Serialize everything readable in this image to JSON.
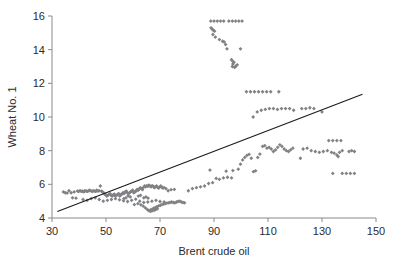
{
  "chart_data": {
    "type": "scatter",
    "title": "",
    "xlabel": "Brent crude oil",
    "ylabel": "Wheat No. 1",
    "xlim": [
      30,
      150
    ],
    "ylim": [
      4,
      16
    ],
    "xticks": [
      30,
      50,
      70,
      90,
      110,
      130,
      150
    ],
    "yticks": [
      4,
      6,
      8,
      10,
      12,
      14,
      16
    ],
    "grid": false,
    "legend": null,
    "marker_color": "#808285",
    "marker_shape": "diamond",
    "trendline": {
      "label": "linear fit",
      "color": "#1a1a1a",
      "x": [
        32.0,
        145.0
      ],
      "y": [
        4.38,
        11.35
      ]
    },
    "points": [
      [
        34.2,
        5.55
      ],
      [
        34.9,
        5.5
      ],
      [
        35.6,
        5.48
      ],
      [
        36.3,
        5.62
      ],
      [
        37.1,
        5.5
      ],
      [
        37.6,
        5.2
      ],
      [
        38.2,
        5.55
      ],
      [
        38.9,
        5.18
      ],
      [
        39.4,
        5.6
      ],
      [
        39.9,
        5.58
      ],
      [
        40.4,
        5.62
      ],
      [
        40.9,
        5.58
      ],
      [
        41.3,
        5.6
      ],
      [
        41.8,
        5.55
      ],
      [
        42.2,
        5.62
      ],
      [
        42.7,
        5.6
      ],
      [
        43.1,
        5.58
      ],
      [
        43.6,
        5.62
      ],
      [
        44.0,
        5.65
      ],
      [
        44.5,
        5.6
      ],
      [
        44.9,
        5.58
      ],
      [
        45.3,
        5.62
      ],
      [
        45.8,
        5.6
      ],
      [
        46.2,
        5.58
      ],
      [
        46.6,
        5.65
      ],
      [
        47.0,
        5.6
      ],
      [
        47.4,
        5.62
      ],
      [
        47.9,
        5.9
      ],
      [
        48.3,
        5.6
      ],
      [
        48.7,
        5.55
      ],
      [
        49.1,
        5.5
      ],
      [
        49.5,
        5.42
      ],
      [
        49.9,
        5.38
      ],
      [
        50.3,
        5.3
      ],
      [
        50.7,
        5.35
      ],
      [
        51.1,
        5.4
      ],
      [
        51.5,
        5.45
      ],
      [
        51.9,
        5.35
      ],
      [
        52.3,
        5.3
      ],
      [
        52.7,
        5.38
      ],
      [
        53.1,
        5.42
      ],
      [
        53.5,
        5.3
      ],
      [
        53.9,
        5.35
      ],
      [
        54.3,
        5.4
      ],
      [
        54.7,
        5.45
      ],
      [
        55.1,
        5.3
      ],
      [
        55.5,
        5.38
      ],
      [
        55.9,
        5.42
      ],
      [
        56.3,
        5.5
      ],
      [
        56.7,
        5.45
      ],
      [
        57.1,
        5.55
      ],
      [
        57.5,
        5.6
      ],
      [
        57.9,
        5.5
      ],
      [
        58.3,
        5.45
      ],
      [
        58.7,
        5.5
      ],
      [
        59.1,
        5.55
      ],
      [
        59.5,
        5.6
      ],
      [
        59.9,
        5.65
      ],
      [
        60.3,
        5.5
      ],
      [
        60.7,
        5.55
      ],
      [
        61.1,
        5.6
      ],
      [
        61.5,
        5.7
      ],
      [
        61.9,
        5.65
      ],
      [
        62.3,
        5.72
      ],
      [
        62.7,
        5.8
      ],
      [
        63.1,
        5.75
      ],
      [
        63.5,
        5.68
      ],
      [
        63.9,
        5.82
      ],
      [
        64.3,
        5.9
      ],
      [
        64.7,
        5.85
      ],
      [
        65.1,
        5.92
      ],
      [
        65.5,
        5.88
      ],
      [
        65.9,
        5.95
      ],
      [
        66.3,
        5.9
      ],
      [
        66.7,
        5.85
      ],
      [
        67.1,
        5.92
      ],
      [
        67.5,
        5.88
      ],
      [
        67.9,
        5.8
      ],
      [
        68.3,
        5.85
      ],
      [
        68.7,
        5.9
      ],
      [
        69.1,
        5.82
      ],
      [
        69.5,
        5.78
      ],
      [
        69.9,
        5.85
      ],
      [
        70.3,
        5.9
      ],
      [
        70.7,
        5.82
      ],
      [
        71.1,
        5.78
      ],
      [
        71.5,
        5.8
      ],
      [
        72.2,
        5.75
      ],
      [
        73.0,
        5.62
      ],
      [
        74.1,
        5.68
      ],
      [
        75.3,
        5.7
      ],
      [
        41.5,
        5.1
      ],
      [
        43.0,
        5.05
      ],
      [
        44.5,
        5.15
      ],
      [
        46.0,
        5.2
      ],
      [
        47.5,
        5.1
      ],
      [
        49.0,
        5.0
      ],
      [
        50.5,
        5.05
      ],
      [
        52.0,
        5.1
      ],
      [
        53.5,
        5.15
      ],
      [
        55.0,
        5.08
      ],
      [
        56.5,
        5.02
      ],
      [
        58.0,
        4.98
      ],
      [
        59.5,
        5.05
      ],
      [
        61.0,
        5.12
      ],
      [
        62.5,
        5.0
      ],
      [
        64.0,
        4.92
      ],
      [
        65.5,
        4.95
      ],
      [
        67.0,
        5.0
      ],
      [
        68.5,
        5.05
      ],
      [
        70.0,
        4.98
      ],
      [
        71.5,
        4.95
      ],
      [
        60.5,
        4.8
      ],
      [
        61.8,
        4.85
      ],
      [
        62.9,
        4.78
      ],
      [
        63.8,
        4.7
      ],
      [
        64.6,
        4.6
      ],
      [
        65.3,
        4.5
      ],
      [
        65.9,
        4.45
      ],
      [
        66.5,
        4.48
      ],
      [
        67.1,
        4.52
      ],
      [
        67.7,
        4.58
      ],
      [
        68.3,
        4.62
      ],
      [
        68.9,
        4.68
      ],
      [
        69.5,
        4.72
      ],
      [
        70.1,
        4.75
      ],
      [
        70.7,
        4.8
      ],
      [
        71.3,
        4.82
      ],
      [
        71.9,
        4.85
      ],
      [
        72.5,
        4.88
      ],
      [
        73.1,
        4.9
      ],
      [
        73.7,
        4.92
      ],
      [
        74.3,
        4.95
      ],
      [
        74.9,
        4.92
      ],
      [
        75.5,
        4.9
      ],
      [
        76.1,
        4.95
      ],
      [
        76.7,
        4.98
      ],
      [
        77.3,
        5.0
      ],
      [
        77.9,
        4.95
      ],
      [
        78.5,
        4.92
      ],
      [
        79.1,
        4.9
      ],
      [
        66.0,
        4.42
      ],
      [
        66.6,
        4.4
      ],
      [
        67.2,
        4.44
      ],
      [
        67.8,
        4.46
      ],
      [
        68.4,
        4.5
      ],
      [
        69.0,
        4.55
      ],
      [
        64.0,
        5.2
      ],
      [
        64.8,
        5.25
      ],
      [
        65.6,
        5.18
      ],
      [
        62.0,
        5.3
      ],
      [
        62.8,
        5.35
      ],
      [
        59.0,
        5.25
      ],
      [
        58.2,
        5.32
      ],
      [
        57.4,
        5.2
      ],
      [
        56.6,
        5.15
      ],
      [
        80.5,
        5.62
      ],
      [
        82.0,
        5.75
      ],
      [
        83.5,
        5.8
      ],
      [
        85.0,
        5.85
      ],
      [
        86.5,
        5.9
      ],
      [
        88.0,
        6.05
      ],
      [
        89.5,
        6.1
      ],
      [
        90.8,
        6.35
      ],
      [
        92.0,
        6.3
      ],
      [
        93.5,
        6.38
      ],
      [
        95.0,
        6.42
      ],
      [
        96.5,
        6.38
      ],
      [
        88.5,
        6.85
      ],
      [
        94.5,
        6.78
      ],
      [
        97.0,
        6.82
      ],
      [
        99.0,
        6.9
      ],
      [
        99.8,
        7.2
      ],
      [
        100.6,
        7.45
      ],
      [
        101.4,
        7.6
      ],
      [
        102.2,
        7.72
      ],
      [
        103.0,
        7.78
      ],
      [
        103.8,
        7.55
      ],
      [
        104.6,
        6.75
      ],
      [
        105.4,
        6.8
      ],
      [
        106.2,
        7.6
      ],
      [
        107.0,
        7.8
      ],
      [
        108.0,
        8.25
      ],
      [
        108.8,
        8.3
      ],
      [
        109.6,
        8.15
      ],
      [
        110.4,
        8.2
      ],
      [
        111.2,
        8.1
      ],
      [
        112.0,
        7.95
      ],
      [
        112.8,
        8.05
      ],
      [
        113.6,
        8.2
      ],
      [
        114.4,
        8.35
      ],
      [
        115.2,
        8.25
      ],
      [
        116.0,
        8.1
      ],
      [
        116.8,
        8.0
      ],
      [
        117.6,
        7.95
      ],
      [
        118.4,
        8.05
      ],
      [
        119.2,
        8.15
      ],
      [
        104.5,
        10.0
      ],
      [
        106.0,
        10.3
      ],
      [
        107.5,
        10.4
      ],
      [
        109.0,
        10.45
      ],
      [
        110.5,
        10.5
      ],
      [
        112.0,
        10.5
      ],
      [
        113.5,
        10.45
      ],
      [
        115.0,
        10.5
      ],
      [
        116.5,
        10.5
      ],
      [
        118.0,
        10.5
      ],
      [
        119.5,
        10.4
      ],
      [
        102.0,
        11.5
      ],
      [
        103.5,
        11.5
      ],
      [
        105.0,
        11.5
      ],
      [
        106.5,
        11.5
      ],
      [
        108.0,
        11.5
      ],
      [
        109.5,
        11.5
      ],
      [
        111.0,
        11.5
      ],
      [
        114.0,
        11.5
      ],
      [
        122.5,
        10.5
      ],
      [
        124.0,
        10.5
      ],
      [
        125.5,
        10.55
      ],
      [
        127.0,
        10.5
      ],
      [
        130.0,
        10.3
      ],
      [
        123.0,
        8.1
      ],
      [
        124.5,
        8.15
      ],
      [
        126.0,
        8.0
      ],
      [
        127.5,
        7.95
      ],
      [
        129.0,
        7.9
      ],
      [
        130.5,
        7.95
      ],
      [
        132.0,
        8.0
      ],
      [
        133.5,
        7.9
      ],
      [
        134.5,
        7.85
      ],
      [
        135.5,
        7.75
      ],
      [
        136.0,
        7.65
      ],
      [
        136.5,
        7.9
      ],
      [
        137.5,
        8.0
      ],
      [
        140.0,
        7.95
      ],
      [
        141.0,
        8.0
      ],
      [
        142.0,
        7.95
      ],
      [
        132.5,
        8.6
      ],
      [
        134.0,
        8.6
      ],
      [
        135.5,
        8.6
      ],
      [
        137.0,
        8.6
      ],
      [
        134.0,
        6.65
      ],
      [
        137.5,
        6.65
      ],
      [
        139.0,
        6.65
      ],
      [
        140.5,
        6.65
      ],
      [
        142.0,
        6.65
      ],
      [
        122.0,
        7.55
      ],
      [
        88.8,
        15.7
      ],
      [
        90.0,
        15.7
      ],
      [
        91.2,
        15.7
      ],
      [
        92.4,
        15.7
      ],
      [
        93.6,
        15.7
      ],
      [
        95.5,
        15.7
      ],
      [
        96.8,
        15.7
      ],
      [
        98.0,
        15.7
      ],
      [
        99.2,
        15.7
      ],
      [
        100.4,
        15.7
      ],
      [
        88.9,
        15.3
      ],
      [
        89.4,
        15.2
      ],
      [
        89.8,
        15.15
      ],
      [
        90.2,
        15.1
      ],
      [
        89.6,
        14.9
      ],
      [
        90.5,
        14.75
      ],
      [
        92.0,
        14.6
      ],
      [
        93.2,
        14.5
      ],
      [
        93.8,
        14.45
      ],
      [
        94.3,
        14.3
      ],
      [
        94.8,
        14.05
      ],
      [
        99.8,
        14.05
      ],
      [
        96.5,
        13.4
      ],
      [
        97.0,
        13.3
      ],
      [
        97.4,
        13.25
      ],
      [
        97.0,
        13.15
      ],
      [
        96.8,
        13.0
      ],
      [
        98.0,
        13.0
      ],
      [
        98.6,
        13.1
      ],
      [
        97.6,
        12.95
      ]
    ]
  },
  "axes": {
    "x_title": "Brent crude oil",
    "y_title": "Wheat No. 1",
    "x_tick_labels": [
      "30",
      "50",
      "70",
      "90",
      "110",
      "130",
      "150"
    ],
    "y_tick_labels": [
      "4",
      "6",
      "8",
      "10",
      "12",
      "14",
      "16"
    ]
  }
}
